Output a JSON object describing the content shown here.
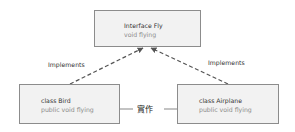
{
  "interface_box": {
    "title": "Interface Fly",
    "method": "void flying"
  },
  "bird_box": {
    "title": "class Bird",
    "method": "public void flying"
  },
  "airplane_box": {
    "title": "class Airplane",
    "method": "public void flying"
  },
  "relations": {
    "left_label": "Implements",
    "right_label": "Implements",
    "center_label": "實作"
  },
  "colors": {
    "box_fill": "#f2f2f2",
    "box_border": "#8c8c8c",
    "line": "#555555"
  }
}
